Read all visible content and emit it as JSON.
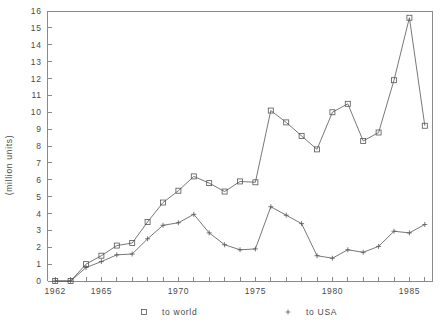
{
  "chart_data": {
    "type": "line",
    "title": "",
    "subtitle": "",
    "xlabel": "",
    "ylabel": "(million units)",
    "xlim": [
      1961.5,
      1986.5
    ],
    "ylim": [
      0,
      16
    ],
    "grid": false,
    "legend_position": "bottom",
    "x": [
      1962,
      1963,
      1964,
      1965,
      1966,
      1967,
      1968,
      1969,
      1970,
      1971,
      1972,
      1973,
      1974,
      1975,
      1976,
      1977,
      1978,
      1979,
      1980,
      1981,
      1982,
      1983,
      1984,
      1985,
      1986
    ],
    "x_ticks": [
      1962,
      1963,
      1964,
      1965,
      1966,
      1967,
      1968,
      1969,
      1970,
      1971,
      1972,
      1973,
      1974,
      1975,
      1976,
      1977,
      1978,
      1979,
      1980,
      1981,
      1982,
      1983,
      1984,
      1985,
      1986
    ],
    "x_tick_labels": [
      "1962",
      "",
      "",
      "1965",
      "",
      "",
      "",
      "",
      "1970",
      "",
      "",
      "",
      "",
      "1975",
      "",
      "",
      "",
      "",
      "1980",
      "",
      "",
      "",
      "",
      "1985",
      ""
    ],
    "y_ticks": [
      0,
      1,
      2,
      3,
      4,
      5,
      6,
      7,
      8,
      9,
      10,
      11,
      12,
      13,
      14,
      15,
      16
    ],
    "y_tick_labels": [
      "0",
      "1",
      "2",
      "3",
      "4",
      "5",
      "6",
      "7",
      "8",
      "9",
      "10",
      "11",
      "12",
      "13",
      "14",
      "15",
      "16"
    ],
    "series": [
      {
        "name": "to world",
        "marker": "square",
        "values": [
          0.0,
          0.0,
          1.0,
          1.5,
          2.1,
          2.25,
          3.5,
          4.65,
          5.35,
          6.2,
          5.8,
          5.3,
          5.9,
          5.85,
          10.1,
          9.4,
          8.6,
          7.8,
          10.0,
          10.5,
          8.3,
          8.8,
          11.9,
          15.6,
          9.2
        ]
      },
      {
        "name": "to USA",
        "marker": "plus",
        "values": [
          0.0,
          0.0,
          0.8,
          1.15,
          1.55,
          1.6,
          2.5,
          3.3,
          3.45,
          3.95,
          2.85,
          2.15,
          1.85,
          1.9,
          4.4,
          3.9,
          3.4,
          1.5,
          1.35,
          1.85,
          1.7,
          2.05,
          2.95,
          2.85,
          3.35
        ]
      }
    ],
    "legend": [
      {
        "marker": "square",
        "label": "to world"
      },
      {
        "marker": "plus",
        "label": "to USA"
      }
    ],
    "colors": {
      "line": "#555555",
      "axis": "#8a8a8a",
      "text": "#4a4a4a",
      "background": "#ffffff"
    }
  }
}
